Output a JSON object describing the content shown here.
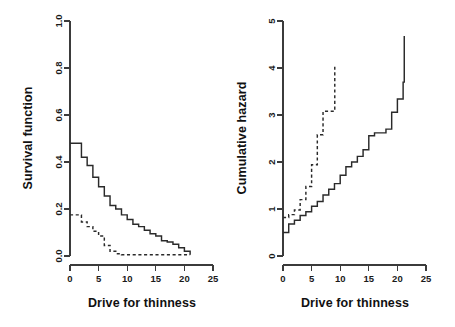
{
  "figure": {
    "background": "#ffffff",
    "line_color": "#2a2a2a",
    "axis_color": "#3b3b3b",
    "panel_count": 2
  },
  "chart_data": [
    {
      "type": "line",
      "title": "",
      "subtitle": "",
      "panel": "left",
      "xlabel": "Drive for thinness",
      "ylabel": "Survival function",
      "xlim": [
        0,
        25
      ],
      "ylim": [
        0,
        1.0
      ],
      "xticks": [
        0,
        5,
        10,
        15,
        20,
        25
      ],
      "xticklabels": [
        "0",
        "5",
        "10",
        "15",
        "20",
        "25"
      ],
      "yticks": [
        0.0,
        0.2,
        0.4,
        0.6,
        0.8,
        1.0
      ],
      "yticklabels": [
        "0.0",
        "0.2",
        "0.4",
        "0.6",
        "0.8",
        "1.0"
      ],
      "grid": false,
      "legend": null,
      "drawstyle": "steps-post",
      "series": [
        {
          "name": "group-1",
          "style": "solid",
          "x": [
            0,
            1,
            2,
            3,
            4,
            5,
            6,
            7,
            8,
            9,
            10,
            11,
            12,
            13,
            14,
            15,
            16,
            17,
            18,
            19,
            20,
            21
          ],
          "values": [
            0.48,
            0.48,
            0.42,
            0.385,
            0.335,
            0.295,
            0.255,
            0.215,
            0.2,
            0.175,
            0.155,
            0.135,
            0.125,
            0.11,
            0.095,
            0.085,
            0.065,
            0.06,
            0.05,
            0.035,
            0.02,
            0.005
          ]
        },
        {
          "name": "group-2",
          "style": "dashed",
          "x": [
            0,
            1,
            2,
            3,
            4,
            5,
            6,
            7,
            8,
            9,
            10,
            21
          ],
          "values": [
            0.175,
            0.175,
            0.145,
            0.125,
            0.105,
            0.085,
            0.045,
            0.02,
            0.01,
            0.005,
            0.005,
            0.005
          ]
        }
      ]
    },
    {
      "type": "line",
      "title": "",
      "subtitle": "",
      "panel": "right",
      "xlabel": "Drive for thinness",
      "ylabel": "Cumulative hazard",
      "xlim": [
        0,
        25
      ],
      "ylim": [
        0,
        5
      ],
      "xticks": [
        0,
        5,
        10,
        15,
        20,
        25
      ],
      "xticklabels": [
        "0",
        "5",
        "10",
        "15",
        "20",
        "25"
      ],
      "yticks": [
        0,
        1,
        2,
        3,
        4,
        5
      ],
      "yticklabels": [
        "0",
        "1",
        "2",
        "3",
        "4",
        "5"
      ],
      "grid": false,
      "legend": null,
      "drawstyle": "steps-post",
      "series": [
        {
          "name": "group-1",
          "style": "solid",
          "x": [
            0,
            1,
            2,
            3,
            4,
            5,
            6,
            7,
            8,
            9,
            10,
            11,
            12,
            13,
            14,
            15,
            16,
            17,
            18,
            19,
            20,
            21,
            21.2
          ],
          "values": [
            0.5,
            0.68,
            0.76,
            0.86,
            0.94,
            1.06,
            1.16,
            1.3,
            1.42,
            1.54,
            1.72,
            1.9,
            2.0,
            2.12,
            2.26,
            2.56,
            2.62,
            2.62,
            2.7,
            3.06,
            3.34,
            3.7,
            4.68
          ]
        },
        {
          "name": "group-2",
          "style": "dashed",
          "x": [
            0,
            1,
            2,
            3,
            4,
            5,
            6,
            7,
            8,
            9,
            9.05
          ],
          "values": [
            0.82,
            0.88,
            0.98,
            1.2,
            1.48,
            1.94,
            2.58,
            3.08,
            3.08,
            3.08,
            4.08
          ]
        }
      ]
    }
  ]
}
